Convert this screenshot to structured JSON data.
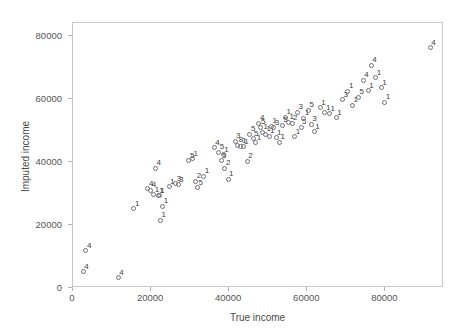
{
  "chart_data": {
    "type": "scatter",
    "title": "",
    "xlabel": "True income",
    "ylabel": "Imputed income",
    "xlim": [
      0,
      95000
    ],
    "ylim": [
      0,
      84000
    ],
    "grid": false,
    "legend": "none",
    "xticks": [
      0,
      20000,
      40000,
      60000,
      80000
    ],
    "xtick_labels": [
      "0",
      "20000",
      "40000",
      "60000",
      "80000"
    ],
    "yticks": [
      0,
      20000,
      40000,
      60000,
      80000
    ],
    "ytick_labels": [
      "0",
      "20000",
      "40000",
      "60000",
      "80000"
    ],
    "marker": "open-circle",
    "point_label_meaning": "imputation-number",
    "points": [
      {
        "x": 2600,
        "y": 5200,
        "label": "4"
      },
      {
        "x": 3300,
        "y": 11800,
        "label": "4"
      },
      {
        "x": 11600,
        "y": 3300,
        "label": "4"
      },
      {
        "x": 15600,
        "y": 25200,
        "label": "1"
      },
      {
        "x": 19200,
        "y": 31500,
        "label": "4"
      },
      {
        "x": 19900,
        "y": 31000,
        "label": "4"
      },
      {
        "x": 20700,
        "y": 29600,
        "label": "1"
      },
      {
        "x": 21100,
        "y": 38000,
        "label": "4"
      },
      {
        "x": 21800,
        "y": 29200,
        "label": "1"
      },
      {
        "x": 22100,
        "y": 29300,
        "label": "1"
      },
      {
        "x": 22400,
        "y": 21400,
        "label": "1"
      },
      {
        "x": 23000,
        "y": 25900,
        "label": "1"
      },
      {
        "x": 24600,
        "y": 32100,
        "label": "1"
      },
      {
        "x": 26300,
        "y": 33000,
        "label": "3"
      },
      {
        "x": 26900,
        "y": 32800,
        "label": "3"
      },
      {
        "x": 29700,
        "y": 40300,
        "label": "5"
      },
      {
        "x": 30600,
        "y": 41000,
        "label": "1"
      },
      {
        "x": 31400,
        "y": 33900,
        "label": "2"
      },
      {
        "x": 31900,
        "y": 31800,
        "label": "5"
      },
      {
        "x": 33500,
        "y": 35400,
        "label": "1"
      },
      {
        "x": 36200,
        "y": 44400,
        "label": "4"
      },
      {
        "x": 37300,
        "y": 43100,
        "label": "5"
      },
      {
        "x": 37900,
        "y": 40300,
        "label": "5"
      },
      {
        "x": 38500,
        "y": 42200,
        "label": "1"
      },
      {
        "x": 38900,
        "y": 38000,
        "label": "2"
      },
      {
        "x": 39700,
        "y": 34500,
        "label": "1"
      },
      {
        "x": 41500,
        "y": 46500,
        "label": "3"
      },
      {
        "x": 42200,
        "y": 45200,
        "label": "8"
      },
      {
        "x": 43000,
        "y": 45000,
        "label": "1"
      },
      {
        "x": 43600,
        "y": 44700,
        "label": "1"
      },
      {
        "x": 44600,
        "y": 40100,
        "label": "2"
      },
      {
        "x": 45300,
        "y": 48800,
        "label": "5"
      },
      {
        "x": 46100,
        "y": 47300,
        "label": "5"
      },
      {
        "x": 46800,
        "y": 46100,
        "label": "1"
      },
      {
        "x": 47600,
        "y": 52200,
        "label": "4"
      },
      {
        "x": 47900,
        "y": 50900,
        "label": "5"
      },
      {
        "x": 48500,
        "y": 49400,
        "label": "1"
      },
      {
        "x": 49300,
        "y": 48700,
        "label": "1"
      },
      {
        "x": 50200,
        "y": 48100,
        "label": "1"
      },
      {
        "x": 50800,
        "y": 51300,
        "label": "1"
      },
      {
        "x": 51400,
        "y": 50800,
        "label": "3"
      },
      {
        "x": 52000,
        "y": 47700,
        "label": "1"
      },
      {
        "x": 52900,
        "y": 46200,
        "label": "1"
      },
      {
        "x": 53600,
        "y": 51600,
        "label": "5"
      },
      {
        "x": 54400,
        "y": 54100,
        "label": "1"
      },
      {
        "x": 55200,
        "y": 52500,
        "label": "1"
      },
      {
        "x": 56100,
        "y": 52300,
        "label": "2"
      },
      {
        "x": 56800,
        "y": 48000,
        "label": "1"
      },
      {
        "x": 57500,
        "y": 55700,
        "label": "3"
      },
      {
        "x": 58400,
        "y": 51000,
        "label": "5"
      },
      {
        "x": 59100,
        "y": 53800,
        "label": "1"
      },
      {
        "x": 60300,
        "y": 56300,
        "label": "5"
      },
      {
        "x": 61000,
        "y": 51900,
        "label": "3"
      },
      {
        "x": 61800,
        "y": 49600,
        "label": "1"
      },
      {
        "x": 63300,
        "y": 57100,
        "label": "1"
      },
      {
        "x": 64500,
        "y": 55600,
        "label": "1"
      },
      {
        "x": 65700,
        "y": 55300,
        "label": "1"
      },
      {
        "x": 67400,
        "y": 54000,
        "label": "1"
      },
      {
        "x": 69000,
        "y": 59600,
        "label": "3"
      },
      {
        "x": 70400,
        "y": 62300,
        "label": "1"
      },
      {
        "x": 71600,
        "y": 58000,
        "label": "1"
      },
      {
        "x": 73100,
        "y": 60500,
        "label": "5"
      },
      {
        "x": 74300,
        "y": 65800,
        "label": "4"
      },
      {
        "x": 75600,
        "y": 62500,
        "label": "1"
      },
      {
        "x": 76400,
        "y": 70600,
        "label": "4"
      },
      {
        "x": 77500,
        "y": 66600,
        "label": "1"
      },
      {
        "x": 78900,
        "y": 63500,
        "label": "1"
      },
      {
        "x": 79800,
        "y": 58900,
        "label": "1"
      },
      {
        "x": 91500,
        "y": 76100,
        "label": "4"
      }
    ]
  }
}
